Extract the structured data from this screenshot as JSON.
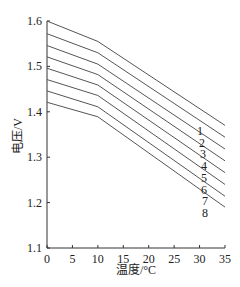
{
  "chart_data": {
    "type": "line",
    "title": "",
    "xlabel": "温度/°C",
    "ylabel": "电压/V",
    "xlim": [
      0,
      35
    ],
    "ylim": [
      1.1,
      1.6
    ],
    "xticks": [
      0,
      5,
      10,
      15,
      20,
      25,
      30,
      35
    ],
    "xtick_labels": [
      "0",
      "5",
      "10",
      "15",
      "20",
      "25",
      "30",
      "35"
    ],
    "yticks": [
      1.1,
      1.2,
      1.3,
      1.4,
      1.5,
      1.6
    ],
    "ytick_labels": [
      "1.1",
      "1.2",
      "1.3",
      "1.4",
      "1.5",
      "1.6"
    ],
    "grid": false,
    "legend": "inline labels at right end of each line",
    "x": [
      0,
      10,
      35
    ],
    "series": [
      {
        "name": "1",
        "values": [
          1.6,
          1.555,
          1.37
        ]
      },
      {
        "name": "2",
        "values": [
          1.572,
          1.53,
          1.344
        ]
      },
      {
        "name": "3",
        "values": [
          1.546,
          1.505,
          1.318
        ]
      },
      {
        "name": "4",
        "values": [
          1.521,
          1.482,
          1.292
        ]
      },
      {
        "name": "5",
        "values": [
          1.496,
          1.459,
          1.266
        ]
      },
      {
        "name": "6",
        "values": [
          1.471,
          1.436,
          1.24
        ]
      },
      {
        "name": "7",
        "values": [
          1.446,
          1.411,
          1.214
        ]
      },
      {
        "name": "8",
        "values": [
          1.421,
          1.389,
          1.19
        ]
      }
    ],
    "line_color": "#555555"
  },
  "labels": {
    "xlabel": "温度/°C",
    "ylabel": "电压/V"
  }
}
